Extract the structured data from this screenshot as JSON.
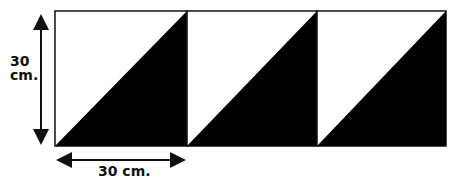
{
  "diagram": {
    "squares": [
      {
        "index": 1,
        "upper_left": "white",
        "lower_right": "black"
      },
      {
        "index": 2,
        "upper_left": "white",
        "lower_right": "black"
      },
      {
        "index": 3,
        "upper_left": "white",
        "lower_right": "black"
      }
    ],
    "colors": {
      "fill_dark": "#000000",
      "fill_light": "#ffffff",
      "stroke": "#111111"
    },
    "dimensions": {
      "height_label_line1": "30",
      "height_label_line2": "cm.",
      "width_label": "30 cm."
    }
  }
}
